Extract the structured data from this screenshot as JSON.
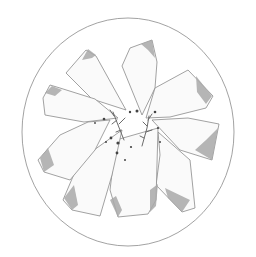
{
  "image": {
    "description": "Pencil sketch of a round plate with sliced pieces arranged radially like flower petals, herb sprigs and pepper dots in the center",
    "colors": {
      "background": "#ffffff",
      "outline": "#8a8a8a",
      "shade": "#a9a9a9",
      "light_shade": "#e6e6e6",
      "dots": "#444444"
    }
  }
}
